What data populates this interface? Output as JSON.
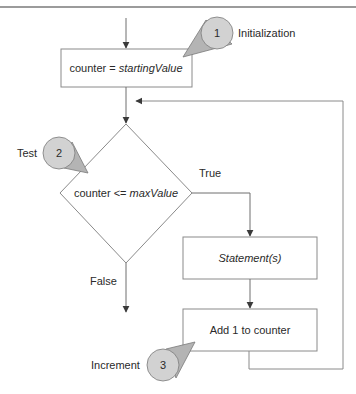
{
  "header": {
    "cut_off_text": ""
  },
  "diagram": {
    "title": "",
    "nodes": {
      "init_box": {
        "prefix": "counter = ",
        "var": "startingValue"
      },
      "test_diamond": {
        "prefix": "counter <= ",
        "var": "maxValue"
      },
      "statement_box": {
        "label": "Statement(s)"
      },
      "increment_box": {
        "label": "Add 1 to counter"
      }
    },
    "edges": {
      "true_label": "True",
      "false_label": "False"
    },
    "callouts": [
      {
        "number": "1",
        "label": "Initialization"
      },
      {
        "number": "2",
        "label": "Test"
      },
      {
        "number": "3",
        "label": "Increment"
      }
    ],
    "colors": {
      "line": "#6e6e6e",
      "box_border": "#8a8a8a",
      "callout_fill": "#d2d2d2",
      "callout_tail": "#b4b4b4",
      "rule": "#7a7a7a",
      "arrowhead": "#3a3a3a"
    }
  }
}
